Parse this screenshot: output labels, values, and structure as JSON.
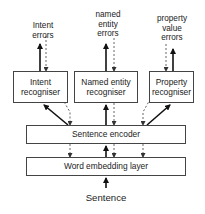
{
  "diagram": {
    "type": "architecture",
    "input_label": "Sentence",
    "layers": {
      "word_embedding": "Word embedding layer",
      "sentence_encoder": "Sentence encoder"
    },
    "recognisers": [
      {
        "id": "intent",
        "line1": "Intent",
        "line2": "recogniser",
        "errors": [
          "Intent",
          "errors"
        ]
      },
      {
        "id": "named_entity",
        "line1": "Named entity",
        "line2": "recogniser",
        "errors": [
          "named",
          "entity",
          "errors"
        ]
      },
      {
        "id": "property",
        "line1": "Property",
        "line2": "recogniser",
        "errors": [
          "property",
          "value",
          "errors"
        ]
      }
    ],
    "edge_styles": {
      "forward": "solid arrow (upward data flow)",
      "backward": "dashed arrow (error backpropagation)"
    },
    "colors": {
      "line": "#222222",
      "dashed": "#555555",
      "box_border": "#444444"
    }
  }
}
